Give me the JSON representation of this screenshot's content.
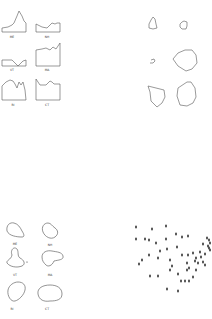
{
  "panels": {
    "top_left": {
      "description": "profile line plots",
      "labels": [
        "ME",
        "NH",
        "VT",
        "MA",
        "RI",
        "CT"
      ]
    },
    "top_right": {
      "description": "polygon outlines",
      "count": 6
    },
    "bottom_left": {
      "description": "smooth blob outlines",
      "labels": [
        "ME",
        "NH",
        "VT",
        "MA",
        "RI",
        "CT"
      ]
    },
    "bottom_right": {
      "description": "scatter of point markers",
      "count": 52
    }
  },
  "colors": {
    "stroke": "#555555",
    "marker": "#333333",
    "background": "#ffffff"
  }
}
